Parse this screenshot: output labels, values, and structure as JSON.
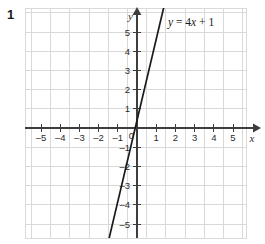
{
  "question": {
    "number": "1"
  },
  "chart_data": {
    "type": "line",
    "title": "",
    "xlabel": "x",
    "ylabel": "y",
    "xlim": [
      -5.75,
      5.75
    ],
    "ylim": [
      -5.75,
      5.9
    ],
    "grid": true,
    "legend": "none",
    "annotations": [
      {
        "name": "equation-label",
        "text": "y = 4x + 1",
        "parts": {
          "lhs": "y",
          "equals": "=",
          "slope": "4",
          "variable": "x",
          "plus": "+",
          "intercept": "1"
        },
        "x": 1.6,
        "y": 5.4
      }
    ],
    "series": [
      {
        "name": "y = 4x + 1",
        "equation": "y = 4x + 1",
        "slope": 4,
        "intercept": 1,
        "color": "#1a1a1a",
        "points": [
          {
            "x": -1.5,
            "y": -5
          },
          {
            "x": -0.25,
            "y": 0
          },
          {
            "x": 0,
            "y": 1
          },
          {
            "x": 1,
            "y": 5
          },
          {
            "x": 1.2,
            "y": 5.8
          }
        ]
      }
    ],
    "x_ticks": [
      -5,
      -4,
      -3,
      -2,
      -1,
      1,
      2,
      3,
      4,
      5
    ],
    "x_tick_labels": [
      "–5",
      "–4",
      "–3",
      "–2",
      "–1",
      "1",
      "2",
      "3",
      "4",
      "5"
    ],
    "y_ticks": [
      5,
      4,
      3,
      2,
      1,
      -1,
      -2,
      -3,
      -4,
      -5
    ],
    "y_tick_labels": [
      "5",
      "4",
      "3",
      "2",
      "1",
      "–1",
      "–2",
      "–3",
      "–4",
      "–5"
    ],
    "origin_label": "0",
    "colors": {
      "grid": "#d9d9d9",
      "axis": "#3d3d3d",
      "line": "#1a1a1a",
      "background": "#ffffff",
      "text": "#2b2b2b"
    }
  }
}
